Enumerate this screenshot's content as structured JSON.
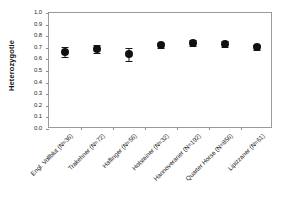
{
  "chart_data": {
    "type": "scatter",
    "title": "",
    "subtitle": "",
    "xlabel": "",
    "ylabel": "Heterozygotie",
    "ylim": [
      0.0,
      1.0
    ],
    "ytick_step": 0.1,
    "grid": false,
    "legend": "none",
    "error_type": "error-bars",
    "marker": "filled-circle-black",
    "categories": [
      "Engl. Vollblut (N=36)",
      "Trakehner (N=72)",
      "Haflinger (N=56)",
      "Holsteiner (N=32)",
      "Hannoveraner (N=192)",
      "Quarter Horse (N=856)",
      "Lipizzaner (N=61)"
    ],
    "values": [
      0.665,
      0.69,
      0.643,
      0.723,
      0.74,
      0.73,
      0.705
    ],
    "errors": [
      0.045,
      0.032,
      0.055,
      0.022,
      0.025,
      0.025,
      0.022
    ],
    "ytick_labels": [
      "1.0",
      "0.9",
      "0.8",
      "0.7",
      "0.6",
      "0.5",
      "0.4",
      "0.3",
      "0.2",
      "0.1",
      "0.0"
    ],
    "ytick_values": [
      1.0,
      0.9,
      0.8,
      0.7,
      0.6,
      0.5,
      0.4,
      0.3,
      0.2,
      0.1,
      0.0
    ]
  }
}
